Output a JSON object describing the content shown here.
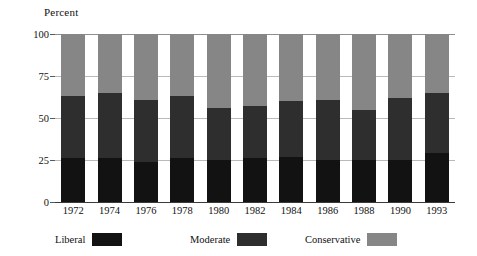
{
  "chart_data": {
    "type": "bar",
    "subtype": "stacked-bar-100",
    "title": "",
    "ylabel": "Percent",
    "xlabel": "",
    "ylim": [
      0,
      100
    ],
    "yticks": [
      0,
      25,
      50,
      75,
      100
    ],
    "ytick_labels": [
      "0",
      "25",
      "50",
      "75",
      "100"
    ],
    "grid": true,
    "legend_position": "bottom",
    "categories": [
      "1972",
      "1974",
      "1976",
      "1978",
      "1980",
      "1982",
      "1984",
      "1986",
      "1988",
      "1990",
      "1993"
    ],
    "series": [
      {
        "name": "Liberal",
        "color": "#121212",
        "values": [
          26,
          26,
          24,
          26,
          25,
          26,
          27,
          25,
          25,
          25,
          29
        ]
      },
      {
        "name": "Moderate",
        "color": "#2e2e2e",
        "values": [
          37,
          39,
          37,
          37,
          31,
          31,
          33,
          36,
          30,
          37,
          36
        ]
      },
      {
        "name": "Conservative",
        "color": "#868686",
        "values": [
          37,
          35,
          39,
          37,
          44,
          43,
          40,
          39,
          45,
          38,
          35
        ]
      }
    ],
    "cumulative_tops": {
      "liberal": [
        26,
        26,
        24,
        26,
        25,
        26,
        27,
        25,
        25,
        25,
        29
      ],
      "moderate": [
        63,
        65,
        61,
        63,
        56,
        57,
        60,
        61,
        55,
        62,
        65
      ],
      "conservative": [
        100,
        100,
        100,
        100,
        100,
        100,
        100,
        100,
        100,
        100,
        100
      ]
    }
  },
  "legend": {
    "items": [
      {
        "label": "Liberal",
        "color": "#121212"
      },
      {
        "label": "Moderate",
        "color": "#2e2e2e"
      },
      {
        "label": "Conservative",
        "color": "#868686"
      }
    ]
  },
  "colors": {
    "liberal": "#121212",
    "moderate": "#2e2e2e",
    "conservative": "#868686",
    "gridline": "#b9b9b9",
    "axis": "#3a3a3a",
    "background": "#ffffff",
    "text": "#111111"
  }
}
